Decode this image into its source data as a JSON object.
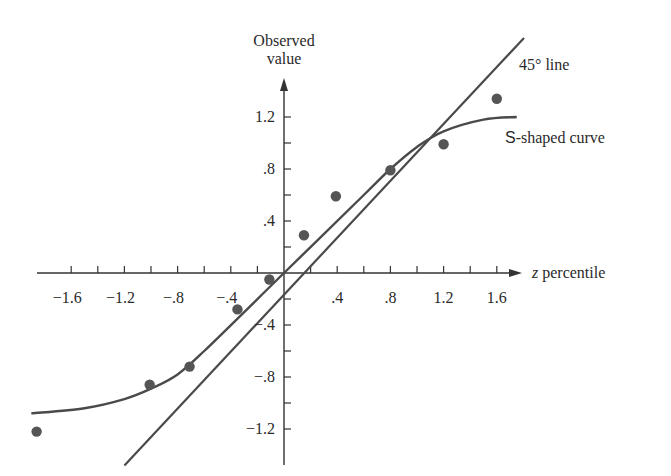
{
  "chart_data": {
    "type": "scatter",
    "title": "",
    "xlabel_var": "z",
    "xlabel_rest": " percentile",
    "xlabel": "z percentile",
    "ylabel_line1": "Observed",
    "ylabel_line2": "value",
    "ylabel": "Observed value",
    "xlim": [
      -1.9,
      1.75
    ],
    "ylim": [
      -1.35,
      1.45
    ],
    "grid": false,
    "x_ticks": [
      -1.6,
      -1.4,
      -1.2,
      -1.0,
      -0.8,
      -0.6,
      -0.4,
      -0.2,
      0.2,
      0.4,
      0.6,
      0.8,
      1.0,
      1.2,
      1.4,
      1.6
    ],
    "x_tick_labels": [
      {
        "value": -1.6,
        "label": "−1.6"
      },
      {
        "value": -1.2,
        "label": "−1.2"
      },
      {
        "value": -0.8,
        "label": "−.8"
      },
      {
        "value": -0.4,
        "label": "−.4"
      },
      {
        "value": 0.4,
        "label": ".4"
      },
      {
        "value": 0.8,
        "label": ".8"
      },
      {
        "value": 1.2,
        "label": "1.2"
      },
      {
        "value": 1.6,
        "label": "1.6"
      }
    ],
    "y_ticks": [
      -1.2,
      -1.0,
      -0.8,
      -0.6,
      -0.4,
      -0.2,
      0.2,
      0.4,
      0.6,
      0.8,
      1.0,
      1.2
    ],
    "y_tick_labels": [
      {
        "value": 1.2,
        "label": "1.2"
      },
      {
        "value": 0.8,
        "label": ".8"
      },
      {
        "value": 0.4,
        "label": ".4"
      },
      {
        "value": -0.4,
        "label": "−.4"
      },
      {
        "value": -0.8,
        "label": "−.8"
      },
      {
        "value": -1.2,
        "label": "−1.2"
      }
    ],
    "series": [
      {
        "name": "Observations",
        "type": "scatter",
        "x": [
          -1.86,
          -1.01,
          -0.71,
          -0.35,
          -0.11,
          0.15,
          0.39,
          0.8,
          1.2,
          1.6
        ],
        "y": [
          -1.22,
          -0.86,
          -0.72,
          -0.28,
          -0.05,
          0.29,
          0.59,
          0.79,
          0.99,
          1.34
        ]
      },
      {
        "name": "45° line",
        "type": "line",
        "x": [
          -1.2,
          1.8
        ],
        "y": [
          -1.2,
          1.8
        ]
      },
      {
        "name": "S-shaped curve",
        "type": "line",
        "x": [
          -1.9,
          -1.5,
          -1.2,
          -1.0,
          -0.8,
          -0.6,
          0.0,
          0.6,
          0.8,
          1.0,
          1.2,
          1.5,
          1.75
        ],
        "y": [
          -1.08,
          -1.04,
          -0.97,
          -0.89,
          -0.78,
          -0.6,
          0.0,
          0.6,
          0.8,
          0.97,
          1.09,
          1.18,
          1.2
        ]
      }
    ],
    "annotations": [
      {
        "text": "45° line",
        "near": "upper end of diagonal line"
      },
      {
        "text_prefix": "S",
        "text": "-shaped curve",
        "near": "right end of S-shaped curve"
      }
    ],
    "point_color": "#555555",
    "line_color": "#4a4a4a"
  }
}
